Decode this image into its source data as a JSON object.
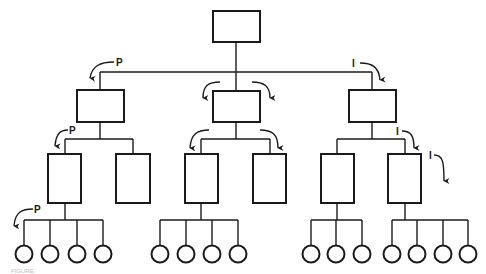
{
  "diagram": {
    "type": "hierarchy",
    "colors": {
      "stroke": "#1a1a1a",
      "background": "#ffffff"
    },
    "levels": [
      {
        "level": 1,
        "shape": "rectangle",
        "count": 1
      },
      {
        "level": 2,
        "shape": "rectangle",
        "count": 3
      },
      {
        "level": 3,
        "shape": "tall-rectangle",
        "count": 6
      },
      {
        "level": 4,
        "shape": "circle",
        "count": 15
      }
    ],
    "labels": {
      "p_top": "P",
      "p_mid": "P",
      "p_bottom": "P",
      "i_top": "I",
      "i_mid": "I",
      "i_right": "I"
    },
    "caption": "FIGURE"
  }
}
